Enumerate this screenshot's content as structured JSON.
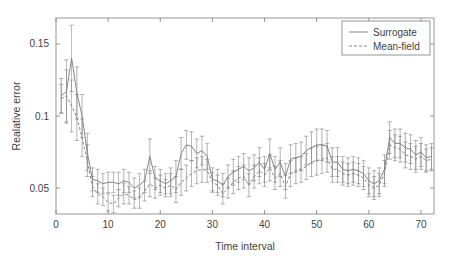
{
  "chart_data": {
    "type": "line",
    "title": "",
    "xlabel": "Time interval",
    "ylabel": "Realative error",
    "xlim": [
      0,
      72.5
    ],
    "ylim": [
      0.032,
      0.168
    ],
    "xticks": [
      0,
      10,
      20,
      30,
      40,
      50,
      60,
      70
    ],
    "xtick_labels": [
      "0",
      "10",
      "20",
      "30",
      "40",
      "50",
      "60",
      "70"
    ],
    "yticks": [
      0.05,
      0.1,
      0.15
    ],
    "ytick_labels": [
      "0.05",
      "0.1",
      "0.15"
    ],
    "grid": false,
    "legend_position": "top-right",
    "error_bars": true,
    "line_color": "#808080",
    "x": [
      1,
      2,
      3,
      4,
      5,
      6,
      7,
      8,
      9,
      10,
      11,
      12,
      13,
      14,
      15,
      16,
      17,
      18,
      19,
      20,
      21,
      22,
      23,
      24,
      25,
      26,
      27,
      28,
      29,
      30,
      31,
      32,
      33,
      34,
      35,
      36,
      37,
      38,
      39,
      40,
      41,
      42,
      43,
      44,
      45,
      46,
      47,
      48,
      49,
      50,
      51,
      52,
      53,
      54,
      55,
      56,
      57,
      58,
      59,
      60,
      61,
      62,
      63,
      64,
      65,
      66,
      67,
      68,
      69,
      70,
      71,
      72
    ],
    "series": [
      {
        "name": "Surrogate",
        "style": "solid",
        "values": [
          0.114,
          0.117,
          0.14,
          0.116,
          0.1,
          0.075,
          0.056,
          0.055,
          0.053,
          0.054,
          0.054,
          0.053,
          0.055,
          0.054,
          0.05,
          0.052,
          0.055,
          0.072,
          0.057,
          0.055,
          0.053,
          0.055,
          0.058,
          0.074,
          0.08,
          0.079,
          0.074,
          0.076,
          0.072,
          0.056,
          0.055,
          0.052,
          0.058,
          0.061,
          0.063,
          0.065,
          0.062,
          0.064,
          0.068,
          0.063,
          0.074,
          0.063,
          0.068,
          0.058,
          0.07,
          0.071,
          0.072,
          0.076,
          0.078,
          0.08,
          0.08,
          0.079,
          0.068,
          0.068,
          0.063,
          0.062,
          0.063,
          0.062,
          0.06,
          0.055,
          0.053,
          0.055,
          0.063,
          0.085,
          0.081,
          0.081,
          0.078,
          0.077,
          0.073,
          0.075,
          0.071,
          0.072
        ],
        "errors": [
          0.012,
          0.022,
          0.023,
          0.018,
          0.015,
          0.013,
          0.008,
          0.008,
          0.007,
          0.007,
          0.007,
          0.008,
          0.008,
          0.007,
          0.007,
          0.008,
          0.008,
          0.012,
          0.008,
          0.008,
          0.007,
          0.009,
          0.011,
          0.011,
          0.01,
          0.01,
          0.01,
          0.01,
          0.009,
          0.008,
          0.008,
          0.008,
          0.008,
          0.009,
          0.009,
          0.009,
          0.009,
          0.009,
          0.01,
          0.009,
          0.01,
          0.009,
          0.01,
          0.009,
          0.01,
          0.01,
          0.01,
          0.01,
          0.011,
          0.011,
          0.011,
          0.011,
          0.01,
          0.01,
          0.009,
          0.009,
          0.009,
          0.009,
          0.009,
          0.009,
          0.009,
          0.009,
          0.01,
          0.011,
          0.01,
          0.01,
          0.01,
          0.01,
          0.01,
          0.01,
          0.009,
          0.009
        ]
      },
      {
        "name": "Mean-field",
        "style": "dashed",
        "values": [
          0.112,
          0.114,
          0.107,
          0.099,
          0.085,
          0.069,
          0.051,
          0.046,
          0.044,
          0.04,
          0.039,
          0.043,
          0.046,
          0.045,
          0.042,
          0.043,
          0.048,
          0.053,
          0.05,
          0.052,
          0.05,
          0.052,
          0.049,
          0.054,
          0.057,
          0.06,
          0.062,
          0.063,
          0.062,
          0.054,
          0.052,
          0.046,
          0.05,
          0.054,
          0.057,
          0.058,
          0.052,
          0.058,
          0.062,
          0.059,
          0.064,
          0.057,
          0.06,
          0.051,
          0.06,
          0.062,
          0.063,
          0.065,
          0.068,
          0.069,
          0.07,
          0.071,
          0.063,
          0.063,
          0.06,
          0.059,
          0.06,
          0.059,
          0.057,
          0.052,
          0.05,
          0.052,
          0.06,
          0.08,
          0.078,
          0.077,
          0.073,
          0.072,
          0.07,
          0.072,
          0.069,
          0.07
        ],
        "errors": [
          0.01,
          0.018,
          0.018,
          0.016,
          0.013,
          0.011,
          0.007,
          0.007,
          0.006,
          0.006,
          0.006,
          0.006,
          0.007,
          0.006,
          0.006,
          0.007,
          0.007,
          0.009,
          0.007,
          0.007,
          0.006,
          0.008,
          0.009,
          0.009,
          0.009,
          0.009,
          0.009,
          0.009,
          0.008,
          0.007,
          0.007,
          0.007,
          0.007,
          0.008,
          0.008,
          0.008,
          0.008,
          0.008,
          0.009,
          0.008,
          0.009,
          0.008,
          0.009,
          0.008,
          0.009,
          0.009,
          0.009,
          0.009,
          0.01,
          0.01,
          0.01,
          0.01,
          0.009,
          0.009,
          0.008,
          0.008,
          0.008,
          0.008,
          0.008,
          0.008,
          0.008,
          0.008,
          0.009,
          0.01,
          0.009,
          0.009,
          0.009,
          0.009,
          0.009,
          0.009,
          0.008,
          0.008
        ]
      }
    ],
    "legend": [
      {
        "label": "Surrogate",
        "style": "solid"
      },
      {
        "label": "Mean-field",
        "style": "dashed"
      }
    ]
  }
}
